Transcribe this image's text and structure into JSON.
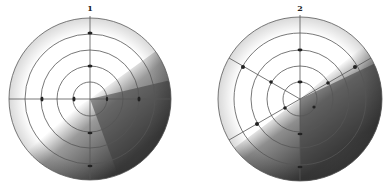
{
  "figure": {
    "panels": [
      {
        "label": "1",
        "cx": 90,
        "cy": 99,
        "r": 81,
        "shade_angle": -35
      },
      {
        "label": "2",
        "cx": 300,
        "cy": 99,
        "r": 82,
        "shade_angle": -55
      }
    ],
    "ring_count": 5,
    "colors": {
      "line": "#555555",
      "shade_dark": "#3a3a3a",
      "shade_light": "#ffffff"
    }
  }
}
